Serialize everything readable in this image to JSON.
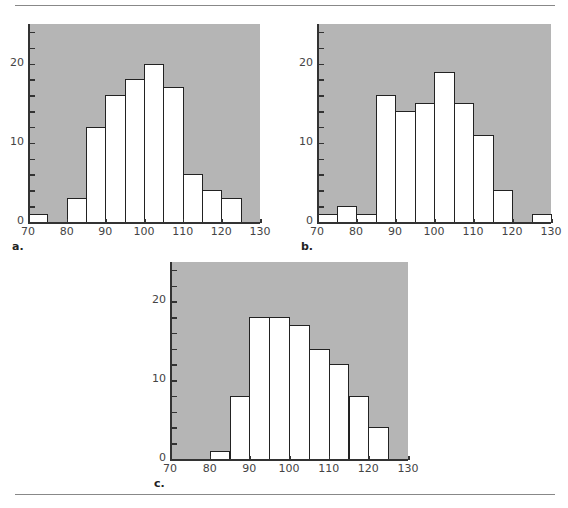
{
  "figure": {
    "background_color": "#b5b5b5",
    "bar_fill": "#ffffff",
    "bar_edge": "#222222"
  },
  "chart_data": [
    {
      "type": "bar",
      "label": "a.",
      "title": "",
      "xlabel": "",
      "ylabel": "",
      "bin_width": 5,
      "bin_starts": [
        70,
        75,
        80,
        85,
        90,
        95,
        100,
        105,
        110,
        115,
        120,
        125
      ],
      "values": [
        1,
        0,
        3,
        12,
        16,
        18,
        20,
        17,
        6,
        4,
        3,
        0
      ],
      "xlim": [
        70,
        130
      ],
      "ylim": [
        0,
        25
      ],
      "xticks": [
        "70",
        "80",
        "90",
        "100",
        "110",
        "120",
        "130"
      ],
      "yticks": [
        "0",
        "10",
        "20"
      ],
      "minor_ytick_step": 2,
      "grid": false
    },
    {
      "type": "bar",
      "label": "b.",
      "title": "",
      "xlabel": "",
      "ylabel": "",
      "bin_width": 5,
      "bin_starts": [
        70,
        75,
        80,
        85,
        90,
        95,
        100,
        105,
        110,
        115,
        120,
        125
      ],
      "values": [
        1,
        2,
        1,
        16,
        14,
        15,
        19,
        15,
        11,
        4,
        0,
        1
      ],
      "xlim": [
        70,
        130
      ],
      "ylim": [
        0,
        25
      ],
      "xticks": [
        "70",
        "80",
        "90",
        "100",
        "110",
        "120",
        "130"
      ],
      "yticks": [
        "0",
        "10",
        "20"
      ],
      "minor_ytick_step": 2,
      "grid": false
    },
    {
      "type": "bar",
      "label": "c.",
      "title": "",
      "xlabel": "",
      "ylabel": "",
      "bin_width": 5,
      "bin_starts": [
        70,
        75,
        80,
        85,
        90,
        95,
        100,
        105,
        110,
        115,
        120,
        125
      ],
      "values": [
        0,
        0,
        1,
        8,
        18,
        18,
        17,
        14,
        12,
        8,
        4,
        0
      ],
      "xlim": [
        70,
        130
      ],
      "ylim": [
        0,
        25
      ],
      "xticks": [
        "70",
        "80",
        "90",
        "100",
        "110",
        "120",
        "130"
      ],
      "yticks": [
        "0",
        "10",
        "20"
      ],
      "minor_ytick_step": 2,
      "grid": false
    }
  ]
}
